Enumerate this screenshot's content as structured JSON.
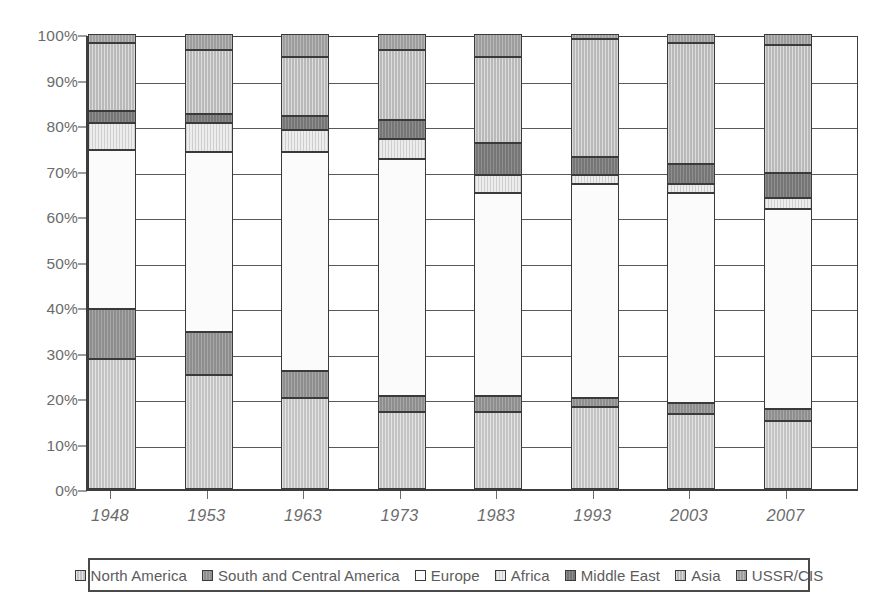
{
  "chart_data": {
    "type": "bar",
    "subtype": "stacked-100-percent",
    "title": "",
    "xlabel": "",
    "ylabel": "",
    "ylim": [
      0,
      100
    ],
    "yunit": "%",
    "grid": true,
    "legend_position": "bottom",
    "categories": [
      "1948",
      "1953",
      "1963",
      "1973",
      "1983",
      "1993",
      "2003",
      "2007"
    ],
    "y_ticks": [
      "0%",
      "10%",
      "20%",
      "30%",
      "40%",
      "50%",
      "60%",
      "70%",
      "80%",
      "90%",
      "100%"
    ],
    "y_tick_values": [
      0,
      10,
      20,
      30,
      40,
      50,
      60,
      70,
      80,
      90,
      100
    ],
    "series": [
      {
        "name": "North America",
        "color": "#c3c3c3",
        "values": [
          28.5,
          25.0,
          20.0,
          17.0,
          17.0,
          18.0,
          16.5,
          15.0
        ]
      },
      {
        "name": "South and Central America",
        "color": "#8e8e8e",
        "values": [
          11.0,
          9.5,
          6.0,
          3.5,
          3.5,
          2.0,
          2.5,
          2.5
        ]
      },
      {
        "name": "Europe",
        "color": "#fbfbfb",
        "values": [
          35.0,
          39.5,
          48.0,
          52.0,
          44.5,
          47.0,
          46.0,
          44.0
        ]
      },
      {
        "name": "Africa",
        "color": "#ededed",
        "values": [
          6.0,
          6.5,
          5.0,
          4.5,
          4.0,
          2.0,
          2.0,
          2.5
        ]
      },
      {
        "name": "Middle East",
        "color": "#767676",
        "values": [
          2.5,
          2.0,
          3.0,
          4.0,
          7.0,
          4.0,
          4.5,
          5.5
        ]
      },
      {
        "name": "Asia",
        "color": "#b9b9b9",
        "values": [
          15.0,
          14.0,
          13.0,
          15.5,
          19.0,
          26.0,
          26.5,
          28.0
        ]
      },
      {
        "name": "USSR/CIS",
        "color": "#9d9d9d",
        "values": [
          2.0,
          3.5,
          5.0,
          3.5,
          5.0,
          1.0,
          2.0,
          2.5
        ]
      }
    ]
  },
  "legend": {
    "items": [
      {
        "label": "North America",
        "fill_class": "fill-north-america"
      },
      {
        "label": "South and Central America",
        "fill_class": "fill-south-central"
      },
      {
        "label": "Europe",
        "fill_class": "fill-europe"
      },
      {
        "label": "Africa",
        "fill_class": "fill-africa"
      },
      {
        "label": "Middle East",
        "fill_class": "fill-middle-east"
      },
      {
        "label": "Asia",
        "fill_class": "fill-asia"
      },
      {
        "label": "USSR/CIS",
        "fill_class": "fill-ussr-cis"
      }
    ]
  },
  "layout": {
    "plot_left": 86,
    "plot_top": 36,
    "plot_width": 772,
    "plot_height": 455,
    "bar_width": 48,
    "bar_slot_width": 96.5,
    "bar_slot_offset": 24
  }
}
